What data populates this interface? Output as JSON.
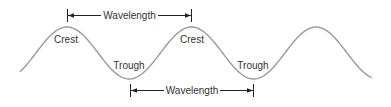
{
  "diagram": {
    "labels": {
      "crest_1": "Crest",
      "crest_2": "Crest",
      "trough_1": "Trough",
      "trough_2": "Trough",
      "wavelength_top": "Wavelength",
      "wavelength_bottom": "Wavelength"
    },
    "colors": {
      "wave": "#9a9a9a",
      "text": "#333333",
      "dimension_line": "#222222"
    }
  }
}
